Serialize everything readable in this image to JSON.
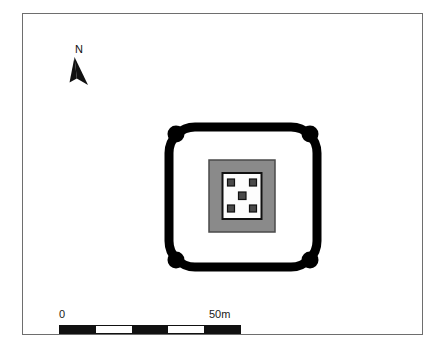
{
  "figure": {
    "type": "archaeological-site-plan",
    "background_color": "#ffffff",
    "frame_color": "#6e6e6e"
  },
  "north_arrow": {
    "label": "N",
    "icon": "north-arrow-icon",
    "color": "#111111"
  },
  "scale_bar": {
    "start_label": "0",
    "end_label": "50m",
    "units": "m",
    "total_length": 50,
    "segments": [
      "fill",
      "blank",
      "fill",
      "blank",
      "fill"
    ],
    "color": "#111111"
  },
  "plan": {
    "enclosure": {
      "name": "outer-enclosure-wall",
      "shape": "rounded-square",
      "wall_color": "#000000",
      "interior_color": "#ffffff"
    },
    "bastions": {
      "name": "corner-bastion",
      "count": 4,
      "shape": "circle",
      "color": "#000000",
      "positions": [
        "northwest",
        "northeast",
        "southwest",
        "southeast"
      ]
    },
    "central_platform": {
      "name": "central-platform",
      "fill_color": "#8a8a8a",
      "border_color": "#4a4a4a"
    },
    "inner_chamber": {
      "name": "inner-chamber",
      "fill_color": "#fdfdfd",
      "border_color": "#111111"
    },
    "post_holes": {
      "name": "post-hole",
      "count": 5,
      "arrangement": "quincunx",
      "fill_color": "#4a4a4a",
      "border_color": "#111111",
      "positions": [
        "northwest",
        "northeast",
        "center",
        "southwest",
        "southeast"
      ]
    }
  }
}
